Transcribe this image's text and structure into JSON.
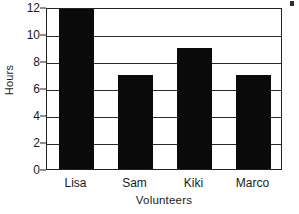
{
  "chart_data": {
    "type": "bar",
    "title": "",
    "categories": [
      "Lisa",
      "Sam",
      "Kiki",
      "Marco"
    ],
    "values": [
      12,
      7,
      9,
      7
    ],
    "series": [
      {
        "name": "Hours",
        "values": [
          12,
          7,
          9,
          7
        ]
      }
    ],
    "xlabel": "Volunteers",
    "ylabel": "Hours",
    "ylim": [
      0,
      12
    ],
    "ytick_values": [
      0,
      2,
      4,
      6,
      8,
      10,
      12
    ],
    "ytick_labels": [
      "0",
      "2",
      "4",
      "6",
      "8",
      "10",
      "12"
    ],
    "grid": "horizontal",
    "legend": "none",
    "bar_color": "#0a0a0a",
    "axis_color": "#222222",
    "background_color": "#ffffff"
  },
  "axes": {
    "y_title": "Hours",
    "x_title": "Volunteers"
  }
}
